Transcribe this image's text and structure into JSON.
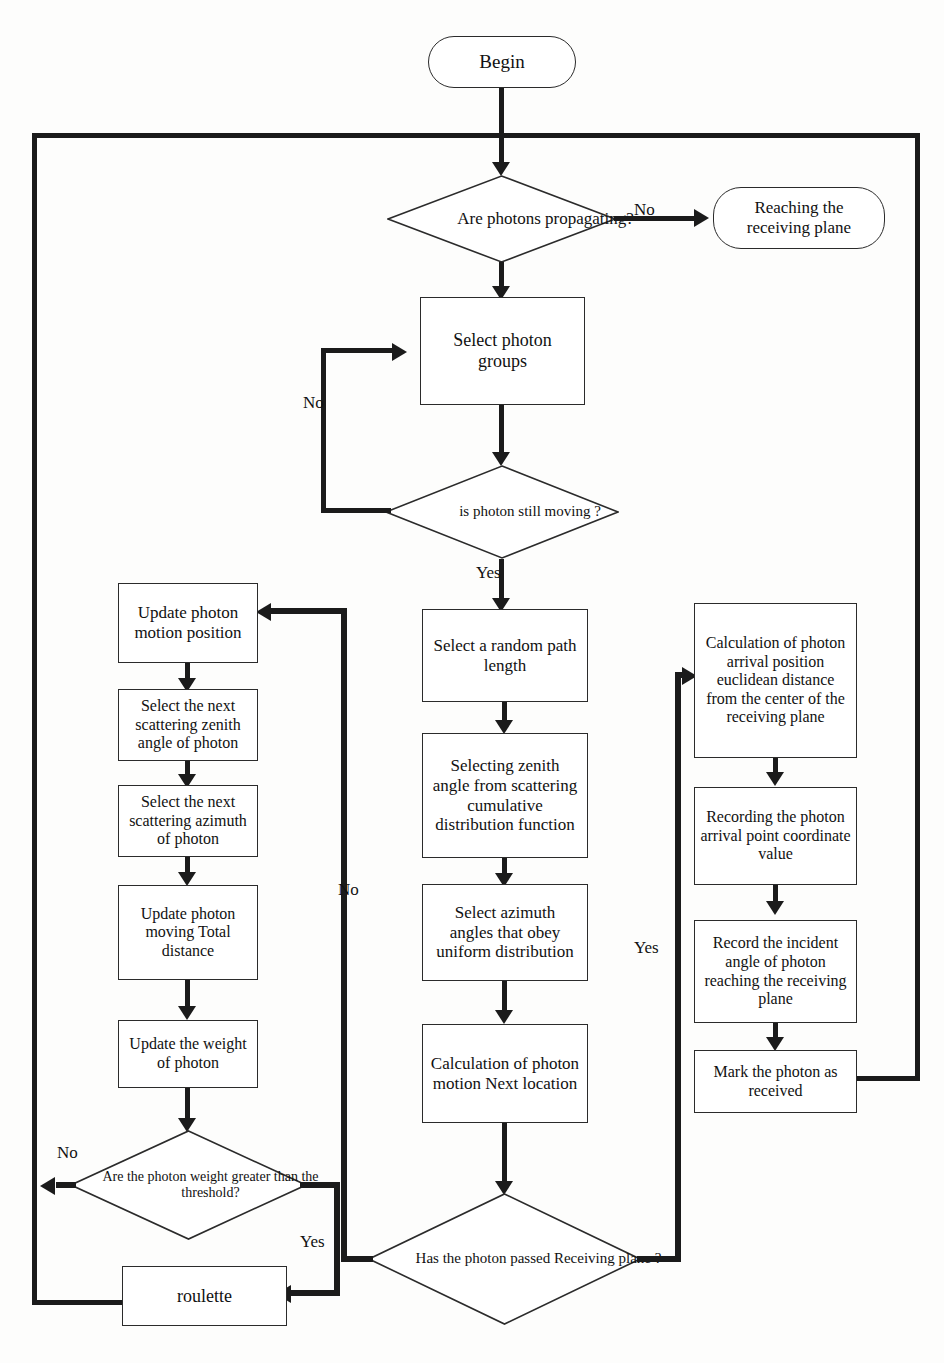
{
  "diagram": {
    "type": "flowchart",
    "line_color": "#1b1b1b",
    "box_fill": "#ffffff"
  },
  "nodes": {
    "begin": {
      "label": "Begin",
      "shape": "terminator"
    },
    "are_photons_propagating": {
      "label": "Are photons propagating?",
      "shape": "decision"
    },
    "reaching_receiving_plane": {
      "label": "Reaching the receiving plane",
      "shape": "terminator"
    },
    "select_photon_groups": {
      "label": "Select photon groups",
      "shape": "process"
    },
    "is_photon_still_moving": {
      "label": "is photon still moving ?",
      "shape": "decision"
    },
    "update_photon_motion_position": {
      "label": "Update photon motion position",
      "shape": "process"
    },
    "select_next_scattering_zenith": {
      "label": "Select the next scattering zenith angle of photon",
      "shape": "process"
    },
    "select_next_scattering_azimuth": {
      "label": "Select the next scattering azimuth of photon",
      "shape": "process"
    },
    "update_photon_total_distance": {
      "label": "Update photon moving Total distance",
      "shape": "process"
    },
    "update_weight_of_photon": {
      "label": "Update the weight of photon",
      "shape": "process"
    },
    "photon_weight_threshold": {
      "label": "Are the photon weight greater than the threshold?",
      "shape": "decision"
    },
    "roulette": {
      "label": "roulette",
      "shape": "process"
    },
    "select_random_path_length": {
      "label": "Select a random path length",
      "shape": "process"
    },
    "selecting_zenith_from_cdf": {
      "label": "Selecting zenith angle from scattering cumulative distribution function",
      "shape": "process"
    },
    "select_azimuth_uniform": {
      "label": "Select azimuth angles that obey uniform distribution",
      "shape": "process"
    },
    "calc_next_location": {
      "label": "Calculation of photon motion Next location",
      "shape": "process"
    },
    "has_passed_receiving_plane": {
      "label": "Has the photon passed Receiving plane ?",
      "shape": "decision"
    },
    "calc_euclidean_distance": {
      "label": "Calculation of photon arrival position euclidean distance from the center of the receiving plane",
      "shape": "process"
    },
    "record_arrival_coordinate": {
      "label": "Recording the photon arrival point coordinate value",
      "shape": "process"
    },
    "record_incident_angle": {
      "label": "Record the incident angle of photon reaching the receiving plane",
      "shape": "process"
    },
    "mark_photon_received": {
      "label": "Mark the photon as received",
      "shape": "process"
    }
  },
  "edge_labels": {
    "propagating_no": "No",
    "still_moving_no": "No",
    "still_moving_yes": "Yes",
    "passed_plane_no": "No",
    "passed_plane_yes": "Yes",
    "weight_no": "No",
    "weight_yes": "Yes"
  }
}
